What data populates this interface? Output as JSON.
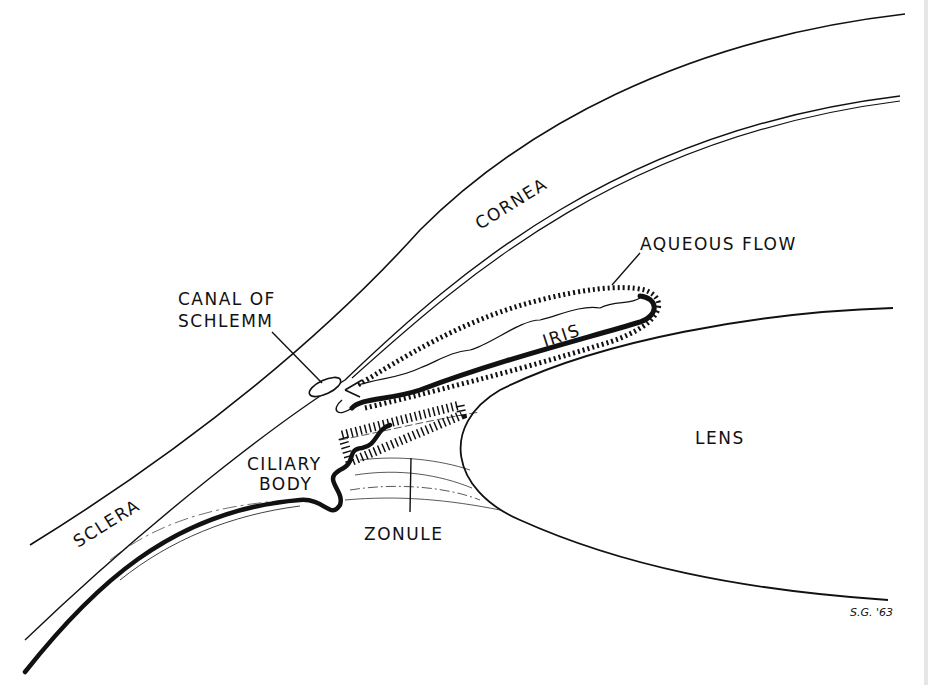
{
  "diagram": {
    "labels": {
      "cornea": "CORNEA",
      "sclera": "SCLERA",
      "canal_line1": "CANAL OF",
      "canal_line2": "SCHLEMM",
      "aqueous_flow": "AQUEOUS FLOW",
      "iris": "IRIS",
      "lens": "LENS",
      "ciliary_line1": "CILIARY",
      "ciliary_line2": "BODY",
      "zonule": "ZONULE",
      "signature": "S.G. '63"
    },
    "colors": {
      "ink": "#111111",
      "background": "#ffffff"
    }
  }
}
